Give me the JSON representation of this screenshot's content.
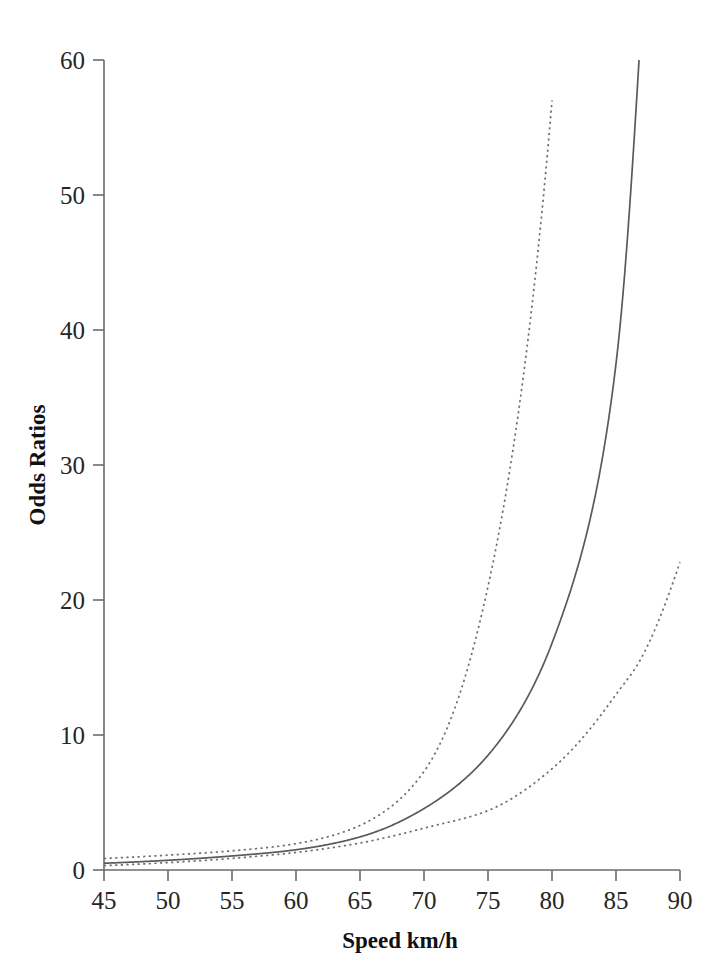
{
  "chart_data": {
    "type": "line",
    "title": "",
    "xlabel": "Speed km/h",
    "ylabel": "Odds Ratios",
    "xlim": [
      45,
      90
    ],
    "ylim": [
      0,
      60
    ],
    "xticks": [
      45,
      50,
      55,
      60,
      65,
      70,
      75,
      80,
      85,
      90
    ],
    "yticks": [
      0,
      10,
      20,
      30,
      40,
      50,
      60
    ],
    "xtick_labels": [
      "45",
      "50",
      "55",
      "60",
      "65",
      "70",
      "75",
      "80",
      "85",
      "90"
    ],
    "ytick_labels": [
      "0",
      "10",
      "20",
      "30",
      "40",
      "50",
      "60"
    ],
    "grid": false,
    "legend": "none",
    "x": [
      45,
      50,
      55,
      60,
      65,
      70,
      75,
      80,
      85,
      86.8,
      90
    ],
    "series": [
      {
        "name": "Odds ratio estimate",
        "style": "solid",
        "color": "#5a5a5a",
        "values": [
          0.5,
          0.72,
          1.04,
          1.5,
          2.45,
          4.55,
          8.5,
          16.8,
          37.5,
          60.0,
          null
        ]
      },
      {
        "name": "Upper 95% confidence limit",
        "style": "dotted",
        "color": "#6f6f6f",
        "values": [
          0.85,
          1.1,
          1.42,
          1.95,
          3.3,
          7.3,
          21.0,
          57.0,
          null,
          null,
          null
        ]
      },
      {
        "name": "Lower 95% confidence limit",
        "style": "dotted",
        "color": "#6f6f6f",
        "values": [
          0.33,
          0.55,
          0.86,
          1.3,
          2.0,
          3.1,
          4.4,
          7.5,
          13.0,
          15.4,
          22.8
        ]
      }
    ],
    "annotations": []
  },
  "axes": {
    "x_title": "Speed km/h",
    "y_title": "Odds Ratios"
  },
  "colors": {
    "axis": "#6b6b6b",
    "solid_curve": "#5a5a5a",
    "dashed_curve": "#6f6f6f",
    "text": "#262626",
    "background": "#ffffff"
  }
}
